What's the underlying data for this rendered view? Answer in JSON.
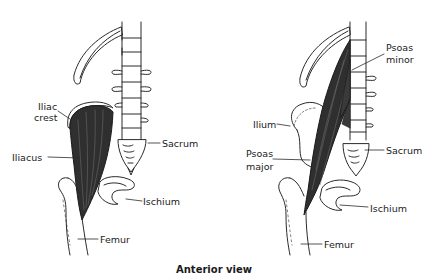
{
  "caption": "Anterior view",
  "panels": [
    {
      "name": "left",
      "highlighted_muscle": "Iliacus",
      "labels": {
        "iliac_crest_1": "Iliac",
        "iliac_crest_2": "crest",
        "iliacus": "Iliacus",
        "sacrum": "Sacrum",
        "ischium": "Ischium",
        "femur": "Femur"
      }
    },
    {
      "name": "right",
      "highlighted_muscle": "Psoas major / Psoas minor",
      "labels": {
        "psoas_minor_1": "Psoas",
        "psoas_minor_2": "minor",
        "ilium": "Ilium",
        "psoas_major_1": "Psoas",
        "psoas_major_2": "major",
        "sacrum": "Sacrum",
        "ischium": "Ischium",
        "femur": "Femur"
      }
    }
  ],
  "colors": {
    "line": "#2a2a2a",
    "muscle": "#2f2f2f",
    "background": "#ffffff"
  }
}
